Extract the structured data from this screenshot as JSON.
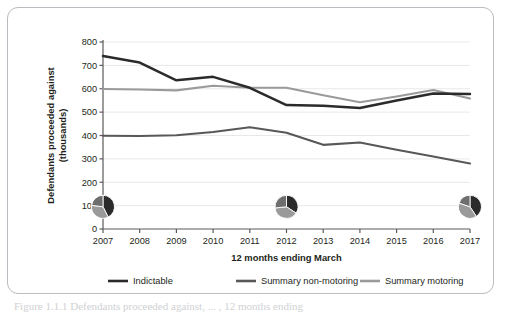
{
  "figure": {
    "caption": "Figure 1.1.1  Defendants proceeded against, ... , 12 months ending"
  },
  "chart_data": {
    "type": "line",
    "title": "",
    "xlabel": "12 months ending March",
    "ylabel": "Defendants proceeded against (thousands)",
    "ylabel_line1": "Defendants proceeded against",
    "ylabel_line2": "(thousands)",
    "categories": [
      "2007",
      "2008",
      "2009",
      "2010",
      "2011",
      "2012",
      "2013",
      "2014",
      "2015",
      "2016",
      "2017"
    ],
    "ylim": [
      0,
      800
    ],
    "yticks": [
      0,
      100,
      200,
      300,
      400,
      500,
      600,
      700,
      800
    ],
    "ytick_labels": [
      "0",
      "100",
      "200",
      "300",
      "400",
      "500",
      "600",
      "700",
      "800"
    ],
    "grid": "horizontal",
    "legend_position": "bottom",
    "series": [
      {
        "name": "Indictable",
        "color": "#2b2b2b",
        "values": [
          740,
          712,
          636,
          651,
          604,
          530,
          527,
          518,
          550,
          580,
          578
        ]
      },
      {
        "name": "Summary non-motoring",
        "color": "#585858",
        "values": [
          399,
          398,
          401,
          415,
          435,
          412,
          360,
          370,
          339,
          310,
          280
        ]
      },
      {
        "name": "Summary motoring",
        "color": "#9a9a9a",
        "values": [
          599,
          597,
          593,
          613,
          604,
          604,
          572,
          542,
          567,
          595,
          558
        ]
      }
    ],
    "pie_insets": [
      {
        "at_category": "2007",
        "slices": [
          {
            "name": "Indictable",
            "value": 740,
            "color": "#2b2b2b"
          },
          {
            "name": "Summary motoring",
            "value": 599,
            "color": "#9a9a9a"
          },
          {
            "name": "Summary non-motoring",
            "value": 399,
            "color": "#6e6e6e"
          }
        ]
      },
      {
        "at_category": "2012",
        "slices": [
          {
            "name": "Indictable",
            "value": 530,
            "color": "#2b2b2b"
          },
          {
            "name": "Summary motoring",
            "value": 604,
            "color": "#9a9a9a"
          },
          {
            "name": "Summary non-motoring",
            "value": 412,
            "color": "#6e6e6e"
          }
        ]
      },
      {
        "at_category": "2017",
        "slices": [
          {
            "name": "Indictable",
            "value": 578,
            "color": "#2b2b2b"
          },
          {
            "name": "Summary motoring",
            "value": 558,
            "color": "#9a9a9a"
          },
          {
            "name": "Summary non-motoring",
            "value": 280,
            "color": "#6e6e6e"
          }
        ]
      }
    ],
    "legend": [
      {
        "label": "Indictable",
        "color": "#2b2b2b"
      },
      {
        "label": "Summary non-motoring",
        "color": "#585858"
      },
      {
        "label": "Summary motoring",
        "color": "#9a9a9a"
      }
    ],
    "colors": {
      "indictable": "#2b2b2b",
      "summary_non_motoring": "#585858",
      "summary_motoring": "#9a9a9a",
      "grid": "#e8e8e8",
      "axis": "#5a5a5a",
      "border": "#b9bcc0"
    }
  }
}
